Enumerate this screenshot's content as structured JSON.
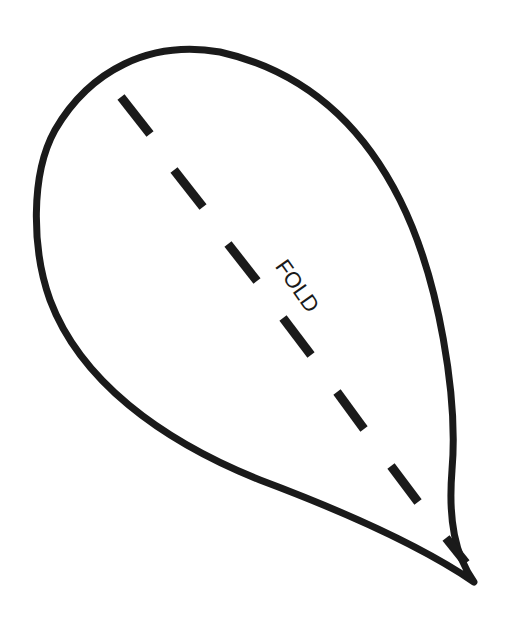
{
  "diagram": {
    "type": "cut-out template",
    "shape": "teardrop / petal outline",
    "colors": {
      "background": "#ffffff",
      "ink": "#1a1a1a"
    },
    "outline": {
      "stroke_width": 7,
      "path": "M 474 582 C 455 555, 448 520, 452 470 C 458 400, 440 280, 400 200 C 360 120, 300 70, 220 52 C 150 40, 90 70, 55 130 C 30 175, 32 250, 50 300 C 80 380, 160 440, 260 480 C 340 510, 420 545, 474 582 Z"
    },
    "fold_line": {
      "stroke_width": 9,
      "dashes": [
        {
          "x1": 121,
          "y1": 97,
          "x2": 150,
          "y2": 134
        },
        {
          "x1": 174,
          "y1": 170,
          "x2": 203,
          "y2": 207
        },
        {
          "x1": 228,
          "y1": 244,
          "x2": 257,
          "y2": 281
        },
        {
          "x1": 283,
          "y1": 318,
          "x2": 311,
          "y2": 355
        },
        {
          "x1": 337,
          "y1": 392,
          "x2": 364,
          "y2": 429
        },
        {
          "x1": 391,
          "y1": 466,
          "x2": 418,
          "y2": 502
        },
        {
          "x1": 446,
          "y1": 538,
          "x2": 466,
          "y2": 563
        }
      ]
    },
    "label": {
      "text": "FOLD",
      "x": 296,
      "y": 287,
      "rotation_deg": 55,
      "font_size": 22
    }
  }
}
